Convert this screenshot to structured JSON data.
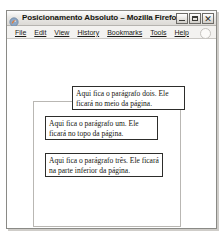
{
  "window": {
    "title": "Posicionamento Absoluto – Mozilla Firefox",
    "icon": "firefox-icon",
    "controls": {
      "minimize_label": "–",
      "maximize_label": "□",
      "close_label": "✕"
    }
  },
  "menubar": {
    "items": [
      {
        "label": "File",
        "accesskey": "F"
      },
      {
        "label": "Edit",
        "accesskey": "E"
      },
      {
        "label": "View",
        "accesskey": "V"
      },
      {
        "label": "History",
        "accesskey": "H"
      },
      {
        "label": "Bookmarks",
        "accesskey": "B"
      },
      {
        "label": "Tools",
        "accesskey": "T"
      },
      {
        "label": "Help",
        "accesskey": "H"
      }
    ],
    "throbber": "throbber-icon"
  },
  "page": {
    "paragraphs": [
      {
        "id": "paragrafo-dois",
        "text": "Aqui fica o parágrafo dois. Ele ficará no meio da página."
      },
      {
        "id": "paragrafo-um",
        "text": "Aqui fica o parágrafo um. Ele ficará no topo da página."
      },
      {
        "id": "paragrafo-tres",
        "text": "Aqui fica o parágrafo três. Ele ficará na parte inferior da página."
      }
    ]
  },
  "colors": {
    "page_background": "#ffffff",
    "chrome_background": "#f2f1ef",
    "paragraph_border": "#2d2d2b",
    "container_border": "#b9b7b3",
    "text": "#16160f"
  }
}
